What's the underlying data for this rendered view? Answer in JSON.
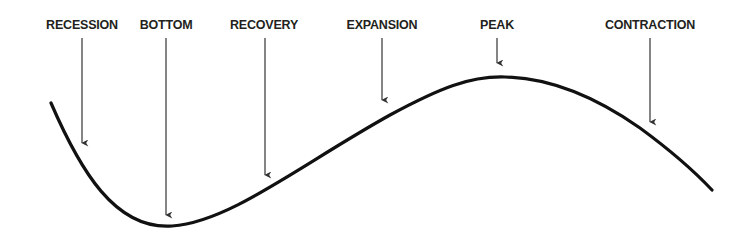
{
  "diagram": {
    "colors": {
      "curve": "#111111",
      "arrow": "#333333",
      "text": "#231f20",
      "background": "#ffffff"
    },
    "phases": [
      {
        "label": "RECESSION",
        "x": 82,
        "arrow_end_y": 143
      },
      {
        "label": "BOTTOM",
        "x": 166,
        "arrow_end_y": 215
      },
      {
        "label": "RECOVERY",
        "x": 265,
        "arrow_end_y": 175
      },
      {
        "label": "EXPANSION",
        "x": 382,
        "arrow_end_y": 100
      },
      {
        "label": "PEAK",
        "x": 497,
        "arrow_end_y": 63
      },
      {
        "label": "CONTRACTION",
        "x": 650,
        "arrow_end_y": 122
      }
    ]
  }
}
